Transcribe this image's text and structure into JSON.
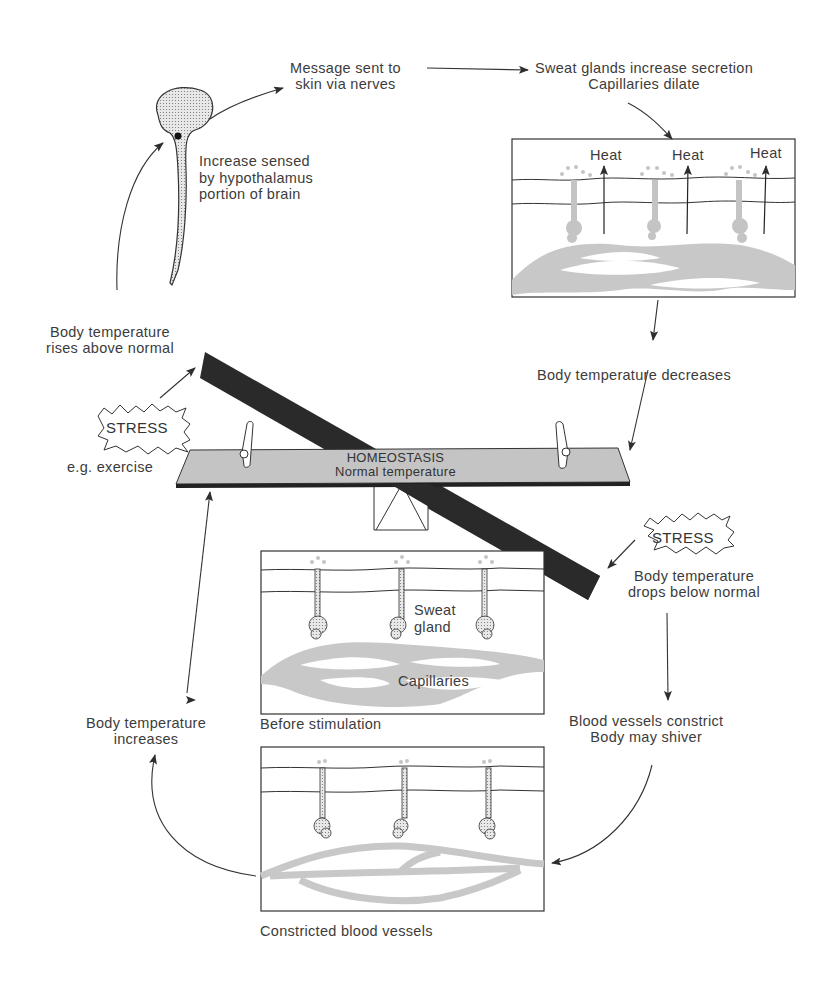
{
  "center": {
    "title": "HOMEOSTASIS",
    "subtitle": "Normal temperature"
  },
  "hot_path": {
    "trigger_badge": "STRESS",
    "trigger_example": "e.g. exercise",
    "step1": [
      "Body temperature",
      "rises above normal"
    ],
    "step2": [
      "Increase sensed",
      "by hypothalamus",
      "portion of brain"
    ],
    "step3": [
      "Message sent to",
      "skin via nerves"
    ],
    "step4": [
      "Sweat glands increase secretion",
      "Capillaries dilate"
    ],
    "heat_labels": [
      "Heat",
      "Heat",
      "Heat"
    ],
    "step5": "Body temperature decreases"
  },
  "cold_path": {
    "trigger_badge": "STRESS",
    "step1": [
      "Body temperature",
      "drops below normal"
    ],
    "step2": [
      "Blood vessels constrict",
      "Body may shiver"
    ],
    "step3": [
      "Body temperature",
      "increases"
    ]
  },
  "panels": {
    "dilated": {
      "caption": ""
    },
    "before": {
      "caption": "Before stimulation",
      "labels": {
        "gland": [
          "Sweat",
          "gland"
        ],
        "capillaries": "Capillaries"
      }
    },
    "constricted": {
      "caption": "Constricted blood vessels"
    }
  },
  "colors": {
    "ink": "#2e2e2e",
    "beam_dark": "#2a2a2a",
    "beam_light": "#c4c4c4",
    "vessel": "#c8c8c8"
  }
}
